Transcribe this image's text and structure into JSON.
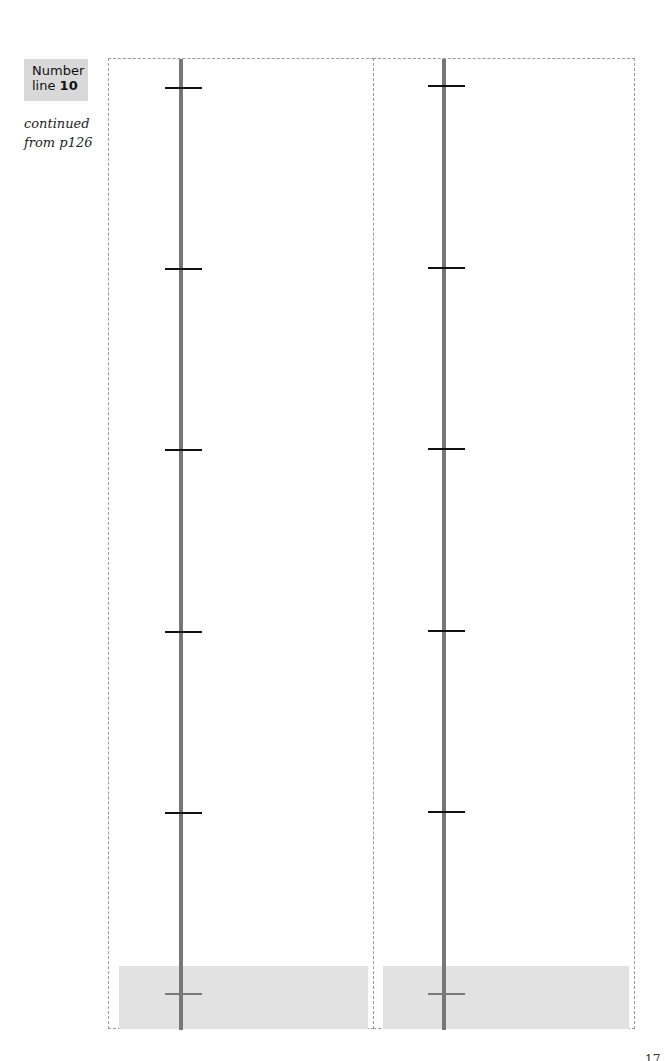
{
  "header": {
    "label_word": "Number",
    "label_line": "line ",
    "label_number": "10",
    "continued_line1": "continued",
    "continued_line2": "from p126"
  },
  "panels": [
    {
      "name": "left",
      "axis_x": 70,
      "tick_ys": [
        29,
        210,
        391,
        573,
        754
      ],
      "shaded_tick_y": 935,
      "shade": {
        "left": 10,
        "top": 907,
        "width": 249,
        "height": 63
      }
    },
    {
      "name": "right",
      "axis_x": 68,
      "tick_ys": [
        27,
        209,
        390,
        572,
        753
      ],
      "shaded_tick_y": 935,
      "shade": {
        "left": 9,
        "top": 907,
        "width": 246,
        "height": 63
      }
    }
  ],
  "colors": {
    "axis": "#777777",
    "tick": "#111111",
    "shaded_tick": "#7a7a7a",
    "shade": "#e2e2e2",
    "label_bg": "#d9d9d9"
  },
  "footer": {
    "page_number": "17"
  }
}
